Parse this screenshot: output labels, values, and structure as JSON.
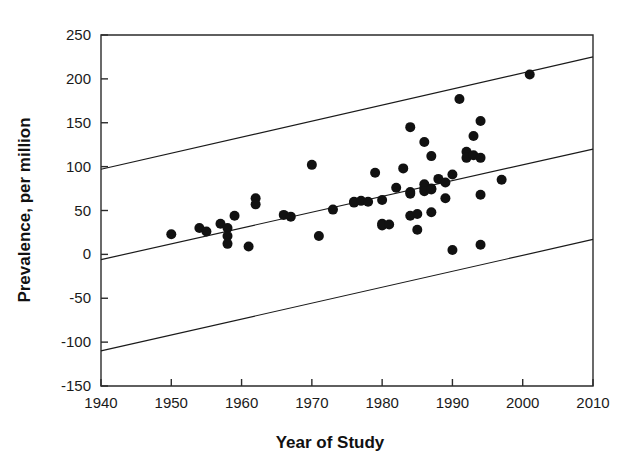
{
  "chart_data": {
    "type": "scatter",
    "title": "",
    "xlabel": "Year of Study",
    "ylabel": "Prevalence, per million",
    "xlim": [
      1940,
      2010
    ],
    "ylim": [
      -150,
      250
    ],
    "xticks": [
      1940,
      1950,
      1960,
      1970,
      1980,
      1990,
      2000,
      2010
    ],
    "yticks": [
      -150,
      -100,
      -50,
      0,
      50,
      100,
      150,
      200,
      250
    ],
    "xtick_labels": [
      "1940",
      "1950",
      "1960",
      "1970",
      "1980",
      "1990",
      "2000",
      "2010"
    ],
    "ytick_labels": [
      "-150",
      "-100",
      "-50",
      "0",
      "50",
      "100",
      "150",
      "200",
      "250"
    ],
    "grid": false,
    "legend": "none",
    "marker": "filled-circle",
    "marker_color": "#111111",
    "line_color": "#1a1a1a",
    "points": [
      {
        "x": 1950,
        "y": 23
      },
      {
        "x": 1954,
        "y": 30
      },
      {
        "x": 1955,
        "y": 26
      },
      {
        "x": 1957,
        "y": 35
      },
      {
        "x": 1958,
        "y": 30
      },
      {
        "x": 1958,
        "y": 21
      },
      {
        "x": 1958,
        "y": 12
      },
      {
        "x": 1959,
        "y": 44
      },
      {
        "x": 1961,
        "y": 9
      },
      {
        "x": 1962,
        "y": 64
      },
      {
        "x": 1962,
        "y": 57
      },
      {
        "x": 1966,
        "y": 45
      },
      {
        "x": 1967,
        "y": 43
      },
      {
        "x": 1970,
        "y": 102
      },
      {
        "x": 1971,
        "y": 21
      },
      {
        "x": 1973,
        "y": 51
      },
      {
        "x": 1976,
        "y": 60
      },
      {
        "x": 1976,
        "y": 59
      },
      {
        "x": 1977,
        "y": 61
      },
      {
        "x": 1978,
        "y": 60
      },
      {
        "x": 1979,
        "y": 93
      },
      {
        "x": 1980,
        "y": 62
      },
      {
        "x": 1980,
        "y": 35
      },
      {
        "x": 1980,
        "y": 33
      },
      {
        "x": 1981,
        "y": 34
      },
      {
        "x": 1982,
        "y": 76
      },
      {
        "x": 1983,
        "y": 98
      },
      {
        "x": 1984,
        "y": 145
      },
      {
        "x": 1984,
        "y": 71
      },
      {
        "x": 1984,
        "y": 69
      },
      {
        "x": 1984,
        "y": 44
      },
      {
        "x": 1985,
        "y": 46
      },
      {
        "x": 1985,
        "y": 28
      },
      {
        "x": 1986,
        "y": 128
      },
      {
        "x": 1986,
        "y": 80
      },
      {
        "x": 1986,
        "y": 75
      },
      {
        "x": 1986,
        "y": 72
      },
      {
        "x": 1987,
        "y": 112
      },
      {
        "x": 1987,
        "y": 75
      },
      {
        "x": 1987,
        "y": 74
      },
      {
        "x": 1987,
        "y": 48
      },
      {
        "x": 1988,
        "y": 86
      },
      {
        "x": 1989,
        "y": 82
      },
      {
        "x": 1989,
        "y": 64
      },
      {
        "x": 1990,
        "y": 91
      },
      {
        "x": 1990,
        "y": 5
      },
      {
        "x": 1991,
        "y": 177
      },
      {
        "x": 1992,
        "y": 117
      },
      {
        "x": 1992,
        "y": 110
      },
      {
        "x": 1993,
        "y": 135
      },
      {
        "x": 1993,
        "y": 113
      },
      {
        "x": 1994,
        "y": 152
      },
      {
        "x": 1994,
        "y": 110
      },
      {
        "x": 1994,
        "y": 68
      },
      {
        "x": 1994,
        "y": 11
      },
      {
        "x": 1997,
        "y": 85
      },
      {
        "x": 2001,
        "y": 205
      }
    ],
    "lines": [
      {
        "name": "upper-confidence-band",
        "x1": 1940,
        "y1": 97,
        "x2": 2010,
        "y2": 225
      },
      {
        "name": "regression-line",
        "x1": 1940,
        "y1": -6,
        "x2": 2010,
        "y2": 120
      },
      {
        "name": "lower-confidence-band",
        "x1": 1940,
        "y1": -110,
        "x2": 2010,
        "y2": 17
      }
    ]
  }
}
